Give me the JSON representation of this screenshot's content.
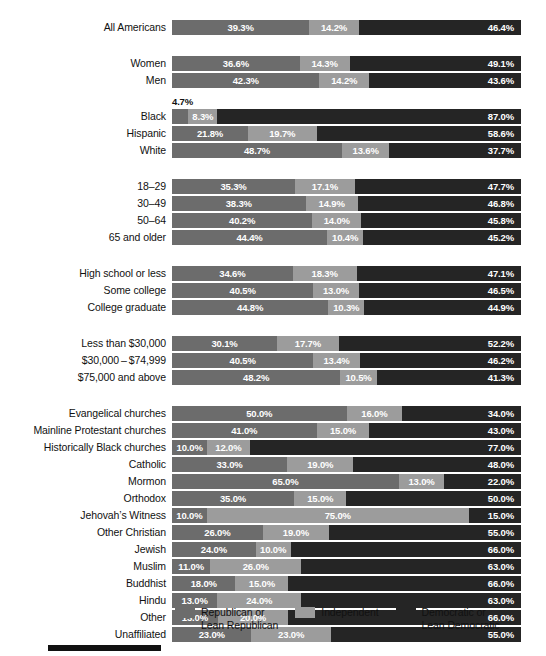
{
  "chart_data": {
    "type": "bar",
    "subtype": "stacked-horizontal-100",
    "title": "",
    "xlabel": "",
    "ylabel": "",
    "xlim": [
      0,
      100
    ],
    "grid": false,
    "legend_position": "bottom",
    "series": [
      {
        "name": "Republican or\nLean Republican",
        "key": "rep",
        "color": "#6c6c6c"
      },
      {
        "name": "Independent",
        "key": "ind",
        "color": "#9c9c9c"
      },
      {
        "name": "Democratic or\nLean Democratic",
        "key": "dem",
        "color": "#252525"
      }
    ],
    "groups": [
      {
        "name": "all",
        "rows": [
          {
            "label": "All Americans",
            "rep": 39.3,
            "ind": 14.2,
            "dem": 46.4,
            "rep_label": "39.3%",
            "ind_label": "14.2%",
            "dem_label": "46.4%"
          }
        ]
      },
      {
        "name": "gender",
        "rows": [
          {
            "label": "Women",
            "rep": 36.6,
            "ind": 14.3,
            "dem": 49.1,
            "rep_label": "36.6%",
            "ind_label": "14.3%",
            "dem_label": "49.1%"
          },
          {
            "label": "Men",
            "rep": 42.3,
            "ind": 14.2,
            "dem": 43.6,
            "rep_label": "42.3%",
            "ind_label": "14.2%",
            "dem_label": "43.6%"
          }
        ]
      },
      {
        "name": "race",
        "rows": [
          {
            "label": "Black",
            "rep": 4.7,
            "ind": 8.3,
            "dem": 87.0,
            "rep_label": "4.7%",
            "ind_label": "8.3%",
            "dem_label": "87.0%",
            "rep_label_outside": true
          },
          {
            "label": "Hispanic",
            "rep": 21.8,
            "ind": 19.7,
            "dem": 58.6,
            "rep_label": "21.8%",
            "ind_label": "19.7%",
            "dem_label": "58.6%"
          },
          {
            "label": "White",
            "rep": 48.7,
            "ind": 13.6,
            "dem": 37.7,
            "rep_label": "48.7%",
            "ind_label": "13.6%",
            "dem_label": "37.7%"
          }
        ]
      },
      {
        "name": "age",
        "rows": [
          {
            "label": "18–29",
            "rep": 35.3,
            "ind": 17.1,
            "dem": 47.7,
            "rep_label": "35.3%",
            "ind_label": "17.1%",
            "dem_label": "47.7%"
          },
          {
            "label": "30–49",
            "rep": 38.3,
            "ind": 14.9,
            "dem": 46.8,
            "rep_label": "38.3%",
            "ind_label": "14.9%",
            "dem_label": "46.8%"
          },
          {
            "label": "50–64",
            "rep": 40.2,
            "ind": 14.0,
            "dem": 45.8,
            "rep_label": "40.2%",
            "ind_label": "14.0%",
            "dem_label": "45.8%"
          },
          {
            "label": "65 and older",
            "rep": 44.4,
            "ind": 10.4,
            "dem": 45.2,
            "rep_label": "44.4%",
            "ind_label": "10.4%",
            "dem_label": "45.2%"
          }
        ]
      },
      {
        "name": "education",
        "rows": [
          {
            "label": "High school or less",
            "rep": 34.6,
            "ind": 18.3,
            "dem": 47.1,
            "rep_label": "34.6%",
            "ind_label": "18.3%",
            "dem_label": "47.1%"
          },
          {
            "label": "Some college",
            "rep": 40.5,
            "ind": 13.0,
            "dem": 46.5,
            "rep_label": "40.5%",
            "ind_label": "13.0%",
            "dem_label": "46.5%"
          },
          {
            "label": "College graduate",
            "rep": 44.8,
            "ind": 10.3,
            "dem": 44.9,
            "rep_label": "44.8%",
            "ind_label": "10.3%",
            "dem_label": "44.9%"
          }
        ]
      },
      {
        "name": "income",
        "rows": [
          {
            "label": "Less than $30,000",
            "rep": 30.1,
            "ind": 17.7,
            "dem": 52.2,
            "rep_label": "30.1%",
            "ind_label": "17.7%",
            "dem_label": "52.2%"
          },
          {
            "label": "$30,000 – $74,999",
            "rep": 40.5,
            "ind": 13.4,
            "dem": 46.2,
            "rep_label": "40.5%",
            "ind_label": "13.4%",
            "dem_label": "46.2%"
          },
          {
            "label": "$75,000 and above",
            "rep": 48.2,
            "ind": 10.5,
            "dem": 41.3,
            "rep_label": "48.2%",
            "ind_label": "10.5%",
            "dem_label": "41.3%"
          }
        ]
      },
      {
        "name": "religion",
        "rows": [
          {
            "label": "Evangelical churches",
            "rep": 50.0,
            "ind": 16.0,
            "dem": 34.0,
            "rep_label": "50.0%",
            "ind_label": "16.0%",
            "dem_label": "34.0%"
          },
          {
            "label": "Mainline Protestant churches",
            "rep": 41.0,
            "ind": 15.0,
            "dem": 43.0,
            "rep_label": "41.0%",
            "ind_label": "15.0%",
            "dem_label": "43.0%"
          },
          {
            "label": "Historically Black churches",
            "rep": 10.0,
            "ind": 12.0,
            "dem": 77.0,
            "rep_label": "10.0%",
            "ind_label": "12.0%",
            "dem_label": "77.0%"
          },
          {
            "label": "Catholic",
            "rep": 33.0,
            "ind": 19.0,
            "dem": 48.0,
            "rep_label": "33.0%",
            "ind_label": "19.0%",
            "dem_label": "48.0%"
          },
          {
            "label": "Mormon",
            "rep": 65.0,
            "ind": 13.0,
            "dem": 22.0,
            "rep_label": "65.0%",
            "ind_label": "13.0%",
            "dem_label": "22.0%"
          },
          {
            "label": "Orthodox",
            "rep": 35.0,
            "ind": 15.0,
            "dem": 50.0,
            "rep_label": "35.0%",
            "ind_label": "15.0%",
            "dem_label": "50.0%"
          },
          {
            "label": "Jehovah’s Witness",
            "rep": 10.0,
            "ind": 75.0,
            "dem": 15.0,
            "rep_label": "10.0%",
            "ind_label": "75.0%",
            "dem_label": "15.0%"
          },
          {
            "label": "Other Christian",
            "rep": 26.0,
            "ind": 19.0,
            "dem": 55.0,
            "rep_label": "26.0%",
            "ind_label": "19.0%",
            "dem_label": "55.0%"
          },
          {
            "label": "Jewish",
            "rep": 24.0,
            "ind": 10.0,
            "dem": 66.0,
            "rep_label": "24.0%",
            "ind_label": "10.0%",
            "dem_label": "66.0%"
          },
          {
            "label": "Muslim",
            "rep": 11.0,
            "ind": 26.0,
            "dem": 63.0,
            "rep_label": "11.0%",
            "ind_label": "26.0%",
            "dem_label": "63.0%"
          },
          {
            "label": "Buddhist",
            "rep": 18.0,
            "ind": 15.0,
            "dem": 66.0,
            "rep_label": "18.0%",
            "ind_label": "15.0%",
            "dem_label": "66.0%"
          },
          {
            "label": "Hindu",
            "rep": 13.0,
            "ind": 24.0,
            "dem": 63.0,
            "rep_label": "13.0%",
            "ind_label": "24.0%",
            "dem_label": "63.0%"
          },
          {
            "label": "Other",
            "rep": 13.0,
            "ind": 20.0,
            "dem": 66.0,
            "rep_label": "13.0%",
            "ind_label": "20.0%",
            "dem_label": "66.0%"
          },
          {
            "label": "Unaffiliated",
            "rep": 23.0,
            "ind": 23.0,
            "dem": 55.0,
            "rep_label": "23.0%",
            "ind_label": "23.0%",
            "dem_label": "55.0%"
          }
        ]
      }
    ]
  },
  "legend": {
    "items": [
      {
        "label": "Republican or\nLean Republican",
        "color": "#6c6c6c",
        "icon": "legend-swatch-republican"
      },
      {
        "label": "Independent",
        "color": "#9c9c9c",
        "icon": "legend-swatch-independent"
      },
      {
        "label": "Democratic or\nLean Democratic",
        "color": "#252525",
        "icon": "legend-swatch-democratic"
      }
    ]
  }
}
